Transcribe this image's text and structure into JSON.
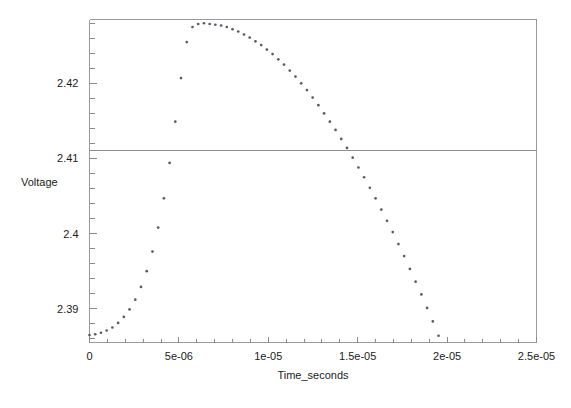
{
  "chart_data": {
    "type": "scatter",
    "title": "",
    "xlabel": "Time_seconds",
    "ylabel": "Voltage",
    "xlim": [
      0,
      2.5e-05
    ],
    "ylim": [
      2.3855,
      2.4285
    ],
    "grid": false,
    "legend": "none",
    "reference_lines": [
      {
        "axis": "y",
        "value": 2.411,
        "label": ""
      }
    ],
    "xticks": [
      {
        "value": 0,
        "label": "0"
      },
      {
        "value": 5e-06,
        "label": "5e-06"
      },
      {
        "value": 1e-05,
        "label": "1e-05"
      },
      {
        "value": 1.5e-05,
        "label": "1.5e-05"
      },
      {
        "value": 2e-05,
        "label": "2e-05"
      },
      {
        "value": 2.5e-05,
        "label": "2.5e-05"
      }
    ],
    "yticks": [
      {
        "value": 2.39,
        "label": "2.39"
      },
      {
        "value": 2.4,
        "label": "2.4"
      },
      {
        "value": 2.41,
        "label": "2.41"
      },
      {
        "value": 2.42,
        "label": "2.42"
      }
    ],
    "x_minor_tick_step": 1e-06,
    "y_minor_tick_step": 0.002,
    "series": [
      {
        "name": "Voltage",
        "marker": "dot",
        "color": "#5a5a66",
        "x": [
          0.0,
          3.2e-07,
          6.4e-07,
          9.6e-07,
          1.28e-06,
          1.6e-06,
          1.92e-06,
          2.24e-06,
          2.56e-06,
          2.88e-06,
          3.2e-06,
          3.52e-06,
          3.84e-06,
          4.16e-06,
          4.48e-06,
          4.8e-06,
          5.12e-06,
          5.44e-06,
          5.76e-06,
          6.08e-06,
          6.4e-06,
          6.72e-06,
          7.04e-06,
          7.36e-06,
          7.68e-06,
          8e-06,
          8.32e-06,
          8.64e-06,
          8.96e-06,
          9.28e-06,
          9.6e-06,
          9.92e-06,
          1.024e-05,
          1.056e-05,
          1.088e-05,
          1.12e-05,
          1.152e-05,
          1.184e-05,
          1.216e-05,
          1.248e-05,
          1.28e-05,
          1.312e-05,
          1.344e-05,
          1.376e-05,
          1.408e-05,
          1.44e-05,
          1.472e-05,
          1.504e-05,
          1.536e-05,
          1.568e-05,
          1.6e-05,
          1.632e-05,
          1.664e-05,
          1.696e-05,
          1.728e-05,
          1.76e-05,
          1.792e-05,
          1.824e-05,
          1.856e-05,
          1.888e-05,
          1.92e-05,
          1.952e-05,
          1.984e-05,
          2.016e-05,
          2.048e-05,
          2.08e-05,
          2.112e-05,
          2.144e-05,
          2.176e-05,
          2.208e-05,
          2.24e-05,
          2.272e-05,
          2.304e-05,
          2.336e-05,
          2.368e-05,
          2.4e-05,
          2.432e-05
        ],
        "y": [
          2.3865,
          2.3866,
          2.3868,
          2.3871,
          2.3875,
          2.3881,
          2.3889,
          2.3899,
          2.3912,
          2.3929,
          2.395,
          2.3976,
          2.4008,
          2.4047,
          2.4094,
          2.4149,
          2.4207,
          2.4255,
          2.4275,
          2.4279,
          2.428,
          2.4279,
          2.4278,
          2.4277,
          2.4275,
          2.4272,
          2.4269,
          2.4265,
          2.4261,
          2.4256,
          2.4251,
          2.4245,
          2.4239,
          2.4232,
          2.4225,
          2.4217,
          2.4209,
          2.42,
          2.4191,
          2.4181,
          2.4171,
          2.416,
          2.4149,
          2.4138,
          2.4126,
          2.4114,
          2.4101,
          2.4088,
          2.4075,
          2.4061,
          2.4047,
          2.4032,
          2.4017,
          2.4002,
          2.3986,
          2.397,
          2.3953,
          2.3936,
          2.3919,
          2.3901,
          2.3883,
          2.3864,
          2.3845,
          2.3826,
          2.3806,
          2.3786,
          2.3765,
          2.3744,
          2.3723,
          2.3701,
          2.3679,
          2.3657,
          2.3634,
          2.3611,
          2.3588,
          2.3564,
          2.354
        ]
      }
    ]
  }
}
